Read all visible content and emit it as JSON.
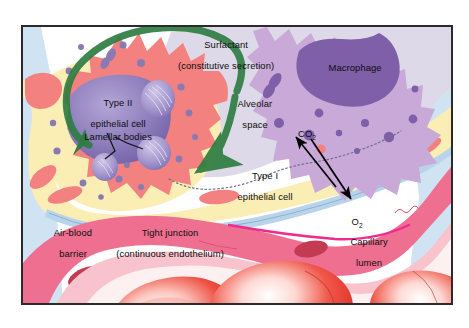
{
  "figure": {
    "title_semantic": "alveolar-air-blood-barrier-diagram",
    "frame": {
      "x": 21,
      "y": 25,
      "width": 432,
      "height": 280,
      "border_color": "#2b2b2b"
    }
  },
  "labels": {
    "surfactant": {
      "line1": "Surfactant",
      "line2": "(constitutive secretion)"
    },
    "macrophage": "Macrophage",
    "alveolar_space": {
      "line1": "Alveolar",
      "line2": "space"
    },
    "type2_cell": {
      "line1": "Type II",
      "line2": "epithelial cell"
    },
    "lamellar_bodies": "Lamellar bodies",
    "type1_cell": {
      "line1": "Type I",
      "line2": "epithelial cell"
    },
    "air_blood_barrier": {
      "line1": "Air-blood",
      "line2": "barrier"
    },
    "tight_junction": {
      "line1": "Tight junction",
      "line2": "(continuous endothelium)"
    },
    "capillary_lumen": {
      "line1": "Capillary",
      "line2": "lumen"
    },
    "co2": {
      "base": "CO",
      "sub": "2"
    },
    "o2": {
      "base": "O",
      "sub": "2"
    }
  },
  "colors": {
    "alveolar_space": "#ded9e8",
    "type2_cytoplasm": "#f2817f",
    "type2_nucleus": "#8a7ab4",
    "lamellar_body": "#9b8ec6",
    "macrophage_cytoplasm": "#c9a9d8",
    "macrophage_nucleus": "#7e5fa8",
    "type1_epithelium": "#fbeeb4",
    "basement_membrane": "#b9d4ea",
    "endothelium": "#ef6f90",
    "capillary_wall_light": "#f8c3cc",
    "capillary_lumen": "#fdf0f0",
    "rbc": "#e8281e",
    "rbc_highlight": "#ffffff",
    "surfactant_arrow": "#2f7d42",
    "gas_arrow": "#000000",
    "outer_blue": "#cfe3f2",
    "frame": "#2b2b2b",
    "text": "#0d0d0d"
  },
  "arrows": {
    "surfactant_curve": {
      "color": "#2f7d42",
      "direction": "right-to-left-over-type2-cell"
    },
    "co2_arrow": {
      "color": "#000000",
      "direction": "up-left",
      "target": "CO2"
    },
    "o2_arrow": {
      "color": "#000000",
      "direction": "down-right",
      "target": "O2"
    },
    "lamellar_pointers": {
      "color": "#111111",
      "count": 2
    }
  }
}
